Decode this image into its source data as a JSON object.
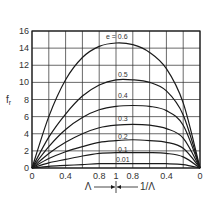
{
  "chart_data": {
    "type": "line",
    "title": "",
    "ylabel": "f_r",
    "xlabel_left": "Λ",
    "xlabel_right": "1/Λ",
    "ylim": [
      0,
      16
    ],
    "y_ticks": [
      "0",
      "2",
      "4",
      "6",
      "8",
      "10",
      "12",
      "14",
      "16"
    ],
    "x_ticks_left": [
      "0",
      "0.4",
      "0.8"
    ],
    "x_center_tick": "1",
    "x_ticks_right": [
      "0.8",
      "0.4",
      "0"
    ],
    "grid": true,
    "legend_param": "e",
    "x_positions": [
      0,
      0.2,
      0.4,
      0.6,
      0.8,
      1.0,
      1.2,
      1.4,
      1.6,
      1.8,
      2.0
    ],
    "x_note": "Left half: Λ from 0 to 1; right half: 1/Λ from 1 back to 0",
    "series": [
      {
        "name": "e = 0.6",
        "label": "e = 0.6",
        "values": [
          0,
          6.0,
          10.3,
          12.9,
          14.2,
          14.6,
          14.4,
          13.5,
          11.6,
          7.6,
          0
        ]
      },
      {
        "name": "0.5",
        "label": "0.5",
        "values": [
          0,
          3.6,
          6.3,
          8.4,
          9.7,
          10.3,
          10.3,
          10.0,
          9.0,
          6.2,
          0
        ]
      },
      {
        "name": "0.4",
        "label": "0.4",
        "values": [
          0,
          2.5,
          4.5,
          5.9,
          6.8,
          7.2,
          7.3,
          7.2,
          6.7,
          5.0,
          0
        ]
      },
      {
        "name": "0.3",
        "label": "0.3",
        "values": [
          0,
          1.7,
          3.0,
          4.0,
          4.7,
          5.0,
          5.1,
          5.0,
          4.6,
          3.5,
          0
        ]
      },
      {
        "name": "0.2",
        "label": "0.2",
        "values": [
          0,
          1.1,
          1.9,
          2.5,
          3.0,
          3.2,
          3.3,
          3.2,
          3.0,
          2.3,
          0
        ]
      },
      {
        "name": "0.1",
        "label": "0.1",
        "values": [
          0,
          0.6,
          1.0,
          1.4,
          1.7,
          1.8,
          1.8,
          1.8,
          1.7,
          1.3,
          0
        ]
      },
      {
        "name": "0.01",
        "label": "0.01",
        "values": [
          0,
          0.2,
          0.3,
          0.4,
          0.5,
          0.5,
          0.5,
          0.5,
          0.5,
          0.4,
          0
        ]
      }
    ]
  },
  "layout": {
    "plot_left": 32,
    "plot_right": 200,
    "plot_top": 31,
    "plot_bottom": 168,
    "line_color": "#1a1a1a",
    "grid_color": "#2a2a2a"
  }
}
